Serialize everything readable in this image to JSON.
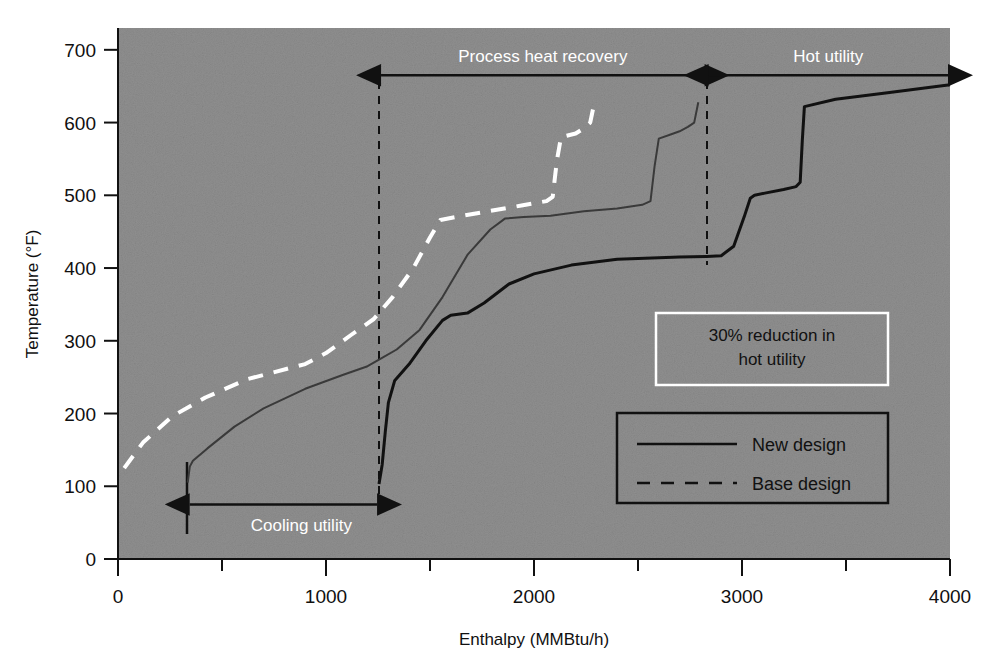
{
  "figure": {
    "background_color": "#8f8f8f",
    "plot_left_px": 118,
    "plot_right_px": 950,
    "plot_top_px": 28,
    "plot_bottom_px": 559
  },
  "chart_data": {
    "type": "line",
    "title": "",
    "xlabel": "Enthalpy (MMBtu/h)",
    "ylabel": "Temperature (°F)",
    "xlim": [
      0,
      4000
    ],
    "ylim": [
      0,
      730
    ],
    "xticks": [
      0,
      1000,
      2000,
      3000,
      4000
    ],
    "xtick_labels": [
      "0",
      "1000",
      "2000",
      "3000",
      "4000"
    ],
    "x_minor_ticks": [
      500,
      1500,
      2500,
      3500
    ],
    "yticks": [
      0,
      100,
      200,
      300,
      400,
      500,
      600,
      700
    ],
    "ytick_labels": [
      "0",
      "100",
      "200",
      "300",
      "400",
      "500",
      "600",
      "700"
    ],
    "grid": false,
    "legend_position": "lower-right",
    "series": [
      {
        "name": "New design",
        "role": "hot-composite-new",
        "style": "solid",
        "color": "#111111",
        "width": 3,
        "points": [
          [
            1255,
            103
          ],
          [
            1270,
            130
          ],
          [
            1285,
            175
          ],
          [
            1300,
            215
          ],
          [
            1330,
            245
          ],
          [
            1400,
            268
          ],
          [
            1480,
            300
          ],
          [
            1560,
            328
          ],
          [
            1600,
            335
          ],
          [
            1680,
            338
          ],
          [
            1760,
            352
          ],
          [
            1880,
            378
          ],
          [
            2000,
            392
          ],
          [
            2180,
            404
          ],
          [
            2400,
            412
          ],
          [
            2700,
            415
          ],
          [
            2830,
            416
          ],
          [
            2900,
            417
          ],
          [
            2960,
            430
          ],
          [
            3010,
            470
          ],
          [
            3040,
            496
          ],
          [
            3060,
            500
          ],
          [
            3110,
            503
          ],
          [
            3200,
            508
          ],
          [
            3260,
            512
          ],
          [
            3280,
            518
          ],
          [
            3290,
            575
          ],
          [
            3300,
            622
          ],
          [
            3450,
            632
          ],
          [
            3700,
            641
          ],
          [
            4000,
            652
          ]
        ]
      },
      {
        "name": "New design",
        "role": "cold-composite-new",
        "style": "solid",
        "color": "#3a3a3a",
        "width": 2,
        "points": [
          [
            335,
            105
          ],
          [
            345,
            127
          ],
          [
            360,
            135
          ],
          [
            430,
            152
          ],
          [
            560,
            182
          ],
          [
            700,
            207
          ],
          [
            900,
            234
          ],
          [
            1080,
            253
          ],
          [
            1200,
            265
          ],
          [
            1255,
            274
          ],
          [
            1340,
            288
          ],
          [
            1450,
            315
          ],
          [
            1560,
            360
          ],
          [
            1680,
            418
          ],
          [
            1790,
            453
          ],
          [
            1860,
            468
          ],
          [
            1950,
            470
          ],
          [
            2080,
            472
          ],
          [
            2240,
            478
          ],
          [
            2400,
            482
          ],
          [
            2520,
            487
          ],
          [
            2560,
            492
          ],
          [
            2580,
            540
          ],
          [
            2600,
            578
          ],
          [
            2660,
            584
          ],
          [
            2700,
            588
          ],
          [
            2740,
            594
          ],
          [
            2770,
            600
          ],
          [
            2790,
            628
          ]
        ]
      },
      {
        "name": "Base design",
        "role": "cold-composite-base",
        "style": "dashed",
        "color": "#ffffff",
        "width": 4,
        "points": [
          [
            30,
            125
          ],
          [
            120,
            160
          ],
          [
            260,
            196
          ],
          [
            420,
            222
          ],
          [
            620,
            247
          ],
          [
            820,
            262
          ],
          [
            900,
            268
          ],
          [
            1000,
            283
          ],
          [
            1120,
            308
          ],
          [
            1230,
            330
          ],
          [
            1320,
            360
          ],
          [
            1420,
            400
          ],
          [
            1500,
            442
          ],
          [
            1550,
            466
          ],
          [
            1620,
            470
          ],
          [
            1780,
            478
          ],
          [
            1940,
            486
          ],
          [
            2060,
            492
          ],
          [
            2090,
            498
          ],
          [
            2110,
            548
          ],
          [
            2130,
            580
          ],
          [
            2200,
            585
          ],
          [
            2240,
            592
          ],
          [
            2270,
            600
          ],
          [
            2290,
            627
          ]
        ]
      }
    ],
    "annotations": [
      {
        "name": "process-heat-recovery",
        "text": "Process heat recovery",
        "x_from": 1255,
        "x_to": 2830,
        "y": 665,
        "color": "#ffffff"
      },
      {
        "name": "hot-utility",
        "text": "Hot utility",
        "x_from": 2830,
        "x_to": 4000,
        "y": 665,
        "color": "#ffffff"
      },
      {
        "name": "cooling-utility",
        "text": "Cooling utility",
        "x_from": 335,
        "x_to": 1255,
        "y": 75,
        "color": "#ffffff"
      }
    ],
    "callout_box": {
      "line1": "30% reduction in",
      "line2": "hot utility",
      "border_color": "#ffffff",
      "text_color": "#111111"
    },
    "legend_entries": [
      {
        "label": "New design",
        "style": "solid"
      },
      {
        "label": "Base design",
        "style": "dashed"
      }
    ]
  }
}
